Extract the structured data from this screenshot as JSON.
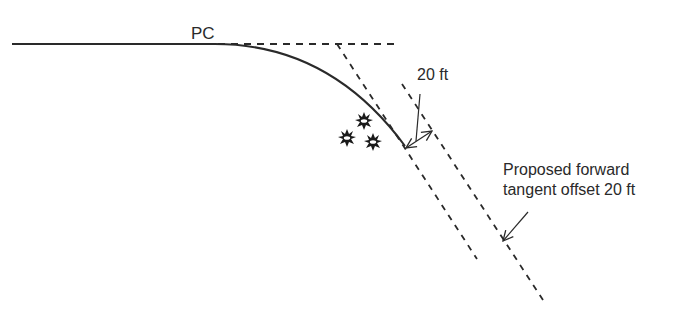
{
  "diagram": {
    "labels": {
      "pc": "PC",
      "offset_distance": "20 ft",
      "proposed_line1": "Proposed forward",
      "proposed_line2": "tangent offset 20 ft"
    },
    "elements": {
      "back_tangent": "solid line",
      "curve": "solid arc from PC",
      "extended_back_tangent": "dashed line",
      "original_forward_tangent": "dashed line",
      "proposed_forward_tangent": "dashed line offset 20 ft",
      "obstructions": 3
    },
    "colors": {
      "line": "#2a2a2a",
      "background": "#ffffff"
    }
  }
}
